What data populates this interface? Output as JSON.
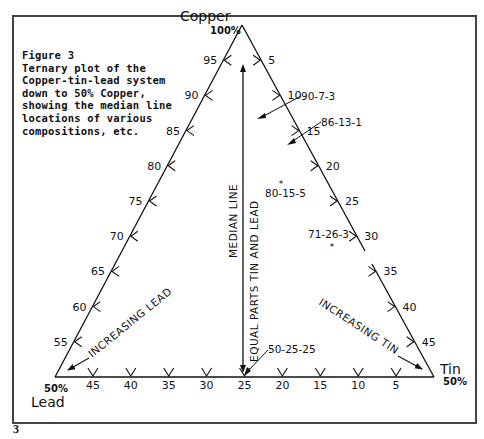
{
  "figure": {
    "caption_lines": [
      "Figure 3",
      "Ternary plot of the",
      "Copper-tin-lead system",
      "down to 50% Copper,",
      "showing the median line",
      "locations of various",
      "compositions, etc."
    ],
    "plate_number": "3"
  },
  "vertices": {
    "top": {
      "name": "Copper",
      "pct": "100%"
    },
    "left": {
      "name": "Lead",
      "pct": "50%"
    },
    "right": {
      "name": "Tin",
      "pct": "50%"
    }
  },
  "axes": {
    "left_edge_ticks": [
      "95",
      "90",
      "85",
      "80",
      "75",
      "70",
      "65",
      "60",
      "55"
    ],
    "right_edge_ticks": [
      "5",
      "10",
      "15",
      "20",
      "25",
      "30",
      "35",
      "40",
      "45"
    ],
    "bottom_edge_ticks": [
      "45",
      "40",
      "35",
      "30",
      "25",
      "20",
      "15",
      "10",
      "5"
    ]
  },
  "labels": {
    "median_line": "MEDIAN LINE",
    "equal_parts": "EQUAL PARTS TIN AND LEAD",
    "increasing_lead": "INCREASING LEAD",
    "increasing_tin": "INCREASING TIN"
  },
  "chart_data": {
    "type": "scatter",
    "title": "Ternary plot of the Copper-tin-lead system down to 50% Copper",
    "axes": [
      "Copper",
      "Tin",
      "Lead"
    ],
    "ranges": {
      "Copper": [
        50,
        100
      ],
      "Tin": [
        0,
        50
      ],
      "Lead": [
        0,
        50
      ]
    },
    "points": [
      {
        "label": "90-7-3",
        "copper": 90,
        "tin": 7,
        "lead": 3
      },
      {
        "label": "86-13-1",
        "copper": 86,
        "tin": 13,
        "lead": 1
      },
      {
        "label": "80-15-5",
        "copper": 80,
        "tin": 15,
        "lead": 5
      },
      {
        "label": "71-26-3",
        "copper": 71,
        "tin": 26,
        "lead": 3
      },
      {
        "label": "50-25-25",
        "copper": 50,
        "tin": 25,
        "lead": 25
      }
    ],
    "annotations": [
      "MEDIAN LINE",
      "EQUAL PARTS TIN AND LEAD",
      "INCREASING LEAD",
      "INCREASING TIN"
    ]
  }
}
